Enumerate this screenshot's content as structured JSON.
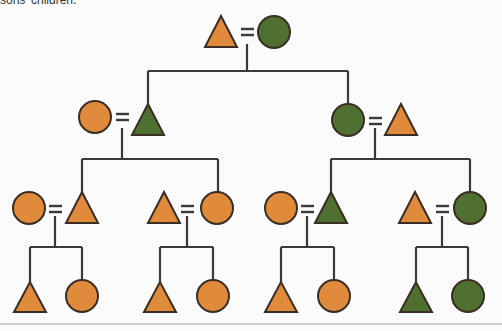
{
  "caption": "sons' children.",
  "colors": {
    "orange": "#e08a3c",
    "green": "#4f7030",
    "stroke": "#3a2e24",
    "line": "#3d3a37"
  },
  "legend_semantics": {
    "triangle": "male",
    "circle": "female",
    "double-bar": "marriage"
  },
  "generations": [
    {
      "level": 1,
      "couples": [
        {
          "id": "g1",
          "left": {
            "shape": "triangle",
            "color": "orange"
          },
          "right": {
            "shape": "circle",
            "color": "green"
          }
        }
      ]
    },
    {
      "level": 2,
      "couples": [
        {
          "id": "g2a",
          "left": {
            "shape": "circle",
            "color": "orange"
          },
          "right": {
            "shape": "triangle",
            "color": "green"
          }
        },
        {
          "id": "g2b",
          "left": {
            "shape": "circle",
            "color": "green"
          },
          "right": {
            "shape": "triangle",
            "color": "orange"
          }
        }
      ]
    },
    {
      "level": 3,
      "couples": [
        {
          "id": "g3a",
          "left": {
            "shape": "circle",
            "color": "orange"
          },
          "right": {
            "shape": "triangle",
            "color": "orange"
          }
        },
        {
          "id": "g3b",
          "left": {
            "shape": "triangle",
            "color": "orange"
          },
          "right": {
            "shape": "circle",
            "color": "orange"
          }
        },
        {
          "id": "g3c",
          "left": {
            "shape": "circle",
            "color": "orange"
          },
          "right": {
            "shape": "triangle",
            "color": "green"
          }
        },
        {
          "id": "g3d",
          "left": {
            "shape": "triangle",
            "color": "orange"
          },
          "right": {
            "shape": "circle",
            "color": "green"
          }
        }
      ]
    },
    {
      "level": 4,
      "sibling_pairs": [
        {
          "id": "g4a",
          "children": [
            {
              "shape": "triangle",
              "color": "orange"
            },
            {
              "shape": "circle",
              "color": "orange"
            }
          ]
        },
        {
          "id": "g4b",
          "children": [
            {
              "shape": "triangle",
              "color": "orange"
            },
            {
              "shape": "circle",
              "color": "orange"
            }
          ]
        },
        {
          "id": "g4c",
          "children": [
            {
              "shape": "triangle",
              "color": "orange"
            },
            {
              "shape": "circle",
              "color": "orange"
            }
          ]
        },
        {
          "id": "g4d",
          "children": [
            {
              "shape": "triangle",
              "color": "green"
            },
            {
              "shape": "circle",
              "color": "green"
            }
          ]
        }
      ]
    }
  ]
}
